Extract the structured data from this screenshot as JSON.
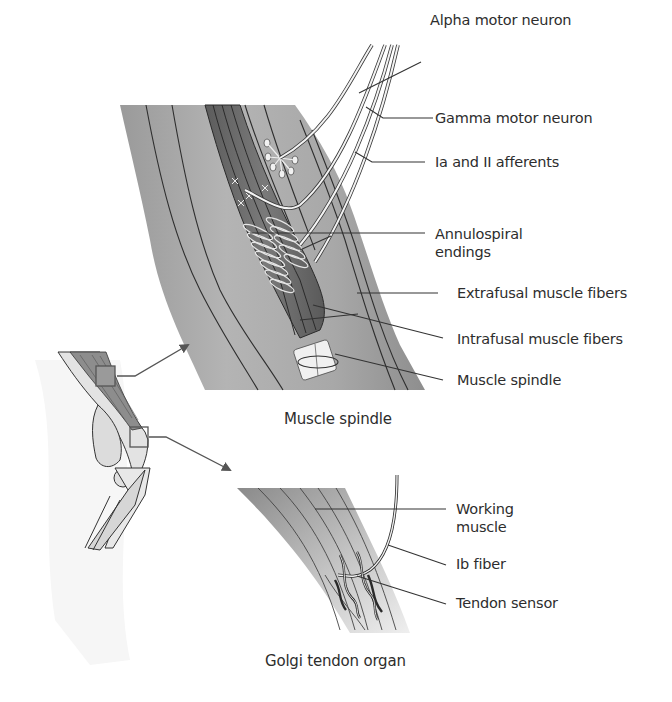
{
  "figure": {
    "panels": [
      {
        "id": "muscle-spindle",
        "caption": "Muscle spindle",
        "labels": {
          "alpha_motor_neuron": "Alpha motor neuron",
          "gamma_motor_neuron": "Gamma motor neuron",
          "ia_ii_afferents": "Ia and II afferents",
          "annulospiral_endings": "Annulospiral endings",
          "extrafusal_muscle_fibers": "Extrafusal muscle fibers",
          "intrafusal_muscle_fibers": "Intrafusal muscle fibers",
          "muscle_spindle": "Muscle spindle"
        }
      },
      {
        "id": "golgi-tendon-organ",
        "caption": "Golgi tendon organ",
        "labels": {
          "working_muscle": "Working muscle",
          "ib_fiber": "Ib fiber",
          "tendon_sensor": "Tendon sensor"
        }
      },
      {
        "id": "knee-overview",
        "caption": "",
        "callouts": [
          "muscle-spindle",
          "golgi-tendon-organ"
        ]
      }
    ],
    "colors": {
      "muscle_light": "#bdbdbd",
      "muscle_mid": "#a3a3a3",
      "spindle_dark": "#6e6e6e",
      "line": "#333333",
      "nerve_fill": "#f2f2f2",
      "text": "#2d2d2d"
    }
  }
}
